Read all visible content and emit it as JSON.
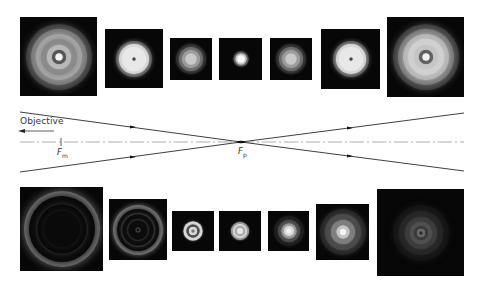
{
  "figure": {
    "colors": {
      "background": "#ffffff",
      "panel_background": "#070707",
      "ray_line": "#2a2a2a",
      "axis_line": "#9a9a9a"
    }
  },
  "diagram": {
    "objective_label": "Objective",
    "focus_m_label": "F",
    "focus_m_subscript": "m",
    "focus_p_label": "F",
    "focus_p_subscript": "p",
    "axis": {
      "y": 142,
      "x_start": 20,
      "x_end": 464,
      "style": "dash-dot"
    },
    "focal_point": {
      "x": 241,
      "y": 142
    },
    "focus_m_tick_x": 61,
    "rays": [
      {
        "name": "upper-left-ray",
        "x1": 20,
        "y1": 112,
        "x2": 241,
        "y2": 142
      },
      {
        "name": "lower-left-ray",
        "x1": 20,
        "y1": 172,
        "x2": 241,
        "y2": 142
      },
      {
        "name": "upper-right-ray",
        "x1": 241,
        "y1": 142,
        "x2": 464,
        "y2": 113
      },
      {
        "name": "lower-right-ray",
        "x1": 241,
        "y1": 142,
        "x2": 464,
        "y2": 171
      }
    ],
    "arrows": [
      {
        "name": "arrow-upper-left",
        "x": 133,
        "y": 127
      },
      {
        "name": "arrow-lower-left",
        "x": 133,
        "y": 157
      },
      {
        "name": "arrow-upper-right",
        "x": 350,
        "y": 128
      },
      {
        "name": "arrow-lower-right",
        "x": 350,
        "y": 156
      }
    ]
  },
  "top_row": [
    {
      "name": "top-pattern-1",
      "x": 20,
      "y": 17,
      "w": 77,
      "h": 79,
      "rings": [
        {
          "d": 66,
          "c": "#3a3a3a"
        },
        {
          "d": 56,
          "c": "#7a7a7a"
        },
        {
          "d": 46,
          "c": "#a5a5a5"
        },
        {
          "d": 36,
          "c": "#8a8a8a"
        },
        {
          "d": 24,
          "c": "#b8b8b8"
        },
        {
          "d": 14,
          "c": "#555555"
        },
        {
          "d": 7,
          "c": "#f2f2f2"
        }
      ]
    },
    {
      "name": "top-pattern-2",
      "x": 105,
      "y": 29,
      "w": 58,
      "h": 59,
      "rings": [
        {
          "d": 36,
          "c": "#5a5a5a"
        },
        {
          "d": 30,
          "c": "#d5d5d5"
        },
        {
          "d": 24,
          "c": "#e8e8e8"
        },
        {
          "d": 3,
          "c": "#444444"
        }
      ]
    },
    {
      "name": "top-pattern-3",
      "x": 170,
      "y": 38,
      "w": 42,
      "h": 42,
      "rings": [
        {
          "d": 30,
          "c": "#2e2e2e"
        },
        {
          "d": 24,
          "c": "#6a6a6a"
        },
        {
          "d": 18,
          "c": "#9c9c9c"
        },
        {
          "d": 11,
          "c": "#c9c9c9"
        }
      ]
    },
    {
      "name": "top-pattern-4",
      "x": 219,
      "y": 38,
      "w": 43,
      "h": 42,
      "rings": [
        {
          "d": 15,
          "c": "#5e5e5e"
        },
        {
          "d": 11,
          "c": "#c6c6c6"
        },
        {
          "d": 7,
          "c": "#f8f8f8"
        }
      ]
    },
    {
      "name": "top-pattern-5",
      "x": 270,
      "y": 38,
      "w": 42,
      "h": 42,
      "rings": [
        {
          "d": 30,
          "c": "#2e2e2e"
        },
        {
          "d": 24,
          "c": "#6a6a6a"
        },
        {
          "d": 18,
          "c": "#9c9c9c"
        },
        {
          "d": 11,
          "c": "#c9c9c9"
        }
      ]
    },
    {
      "name": "top-pattern-6",
      "x": 321,
      "y": 29,
      "w": 59,
      "h": 60,
      "rings": [
        {
          "d": 36,
          "c": "#5a5a5a"
        },
        {
          "d": 30,
          "c": "#d5d5d5"
        },
        {
          "d": 24,
          "c": "#e8e8e8"
        },
        {
          "d": 3,
          "c": "#444444"
        }
      ]
    },
    {
      "name": "top-pattern-7",
      "x": 387,
      "y": 17,
      "w": 77,
      "h": 80,
      "rings": [
        {
          "d": 66,
          "c": "#3a3a3a"
        },
        {
          "d": 56,
          "c": "#7a7a7a"
        },
        {
          "d": 46,
          "c": "#b5b5b5"
        },
        {
          "d": 36,
          "c": "#d0d0d0"
        },
        {
          "d": 24,
          "c": "#c5c5c5"
        },
        {
          "d": 14,
          "c": "#606060"
        },
        {
          "d": 7,
          "c": "#f2f2f2"
        }
      ]
    }
  ],
  "bottom_row": [
    {
      "name": "bottom-pattern-1",
      "x": 20,
      "y": 187,
      "w": 83,
      "h": 84,
      "rings": [
        {
          "d": 76,
          "c": "#6e6e6e"
        },
        {
          "d": 66,
          "c": "#0a0a0a"
        },
        {
          "d": 52,
          "c": "#2a2a2a"
        },
        {
          "d": 49,
          "c": "#0a0a0a"
        },
        {
          "d": 38,
          "c": "#1c1c1c"
        },
        {
          "d": 36,
          "c": "#0a0a0a"
        }
      ]
    },
    {
      "name": "bottom-pattern-2",
      "x": 109,
      "y": 199,
      "w": 58,
      "h": 61,
      "rings": [
        {
          "d": 50,
          "c": "#727272"
        },
        {
          "d": 42,
          "c": "#0c0c0c"
        },
        {
          "d": 34,
          "c": "#3c3c3c"
        },
        {
          "d": 31,
          "c": "#0c0c0c"
        },
        {
          "d": 22,
          "c": "#2c2c2c"
        },
        {
          "d": 19,
          "c": "#0c0c0c"
        },
        {
          "d": 5,
          "c": "#3a3a3a"
        },
        {
          "d": 2,
          "c": "#0c0c0c"
        }
      ]
    },
    {
      "name": "bottom-pattern-3",
      "x": 172,
      "y": 211,
      "w": 42,
      "h": 40,
      "rings": [
        {
          "d": 19,
          "c": "#d8d8d8"
        },
        {
          "d": 13,
          "c": "#4a4a4a"
        },
        {
          "d": 8,
          "c": "#dcdcdc"
        },
        {
          "d": 3,
          "c": "#777777"
        }
      ]
    },
    {
      "name": "bottom-pattern-4",
      "x": 219,
      "y": 211,
      "w": 42,
      "h": 40,
      "rings": [
        {
          "d": 18,
          "c": "#9a9a9a"
        },
        {
          "d": 14,
          "c": "#d5d5d5"
        },
        {
          "d": 10,
          "c": "#a5a5a5"
        },
        {
          "d": 6,
          "c": "#e6e6e6"
        }
      ]
    },
    {
      "name": "bottom-pattern-5",
      "x": 268,
      "y": 211,
      "w": 41,
      "h": 40,
      "rings": [
        {
          "d": 30,
          "c": "#1e1e1e"
        },
        {
          "d": 22,
          "c": "#4a4a4a"
        },
        {
          "d": 15,
          "c": "#9a9a9a"
        },
        {
          "d": 10,
          "c": "#d8d8d8"
        },
        {
          "d": 5,
          "c": "#f2f2f2"
        }
      ]
    },
    {
      "name": "bottom-pattern-6",
      "x": 316,
      "y": 204,
      "w": 53,
      "h": 56,
      "rings": [
        {
          "d": 46,
          "c": "#262626"
        },
        {
          "d": 36,
          "c": "#4a4a4a"
        },
        {
          "d": 24,
          "c": "#7e7e7e"
        },
        {
          "d": 13,
          "c": "#c5c5c5"
        },
        {
          "d": 6,
          "c": "#f6f6f6"
        }
      ]
    },
    {
      "name": "bottom-pattern-7",
      "x": 377,
      "y": 189,
      "w": 87,
      "h": 87,
      "rings": [
        {
          "d": 56,
          "c": "#151515"
        },
        {
          "d": 44,
          "c": "#262626"
        },
        {
          "d": 32,
          "c": "#3c3c3c"
        },
        {
          "d": 22,
          "c": "#505050"
        },
        {
          "d": 14,
          "c": "#3a3a3a"
        },
        {
          "d": 8,
          "c": "#6a6a6a"
        },
        {
          "d": 3,
          "c": "#2a2a2a"
        }
      ]
    }
  ]
}
